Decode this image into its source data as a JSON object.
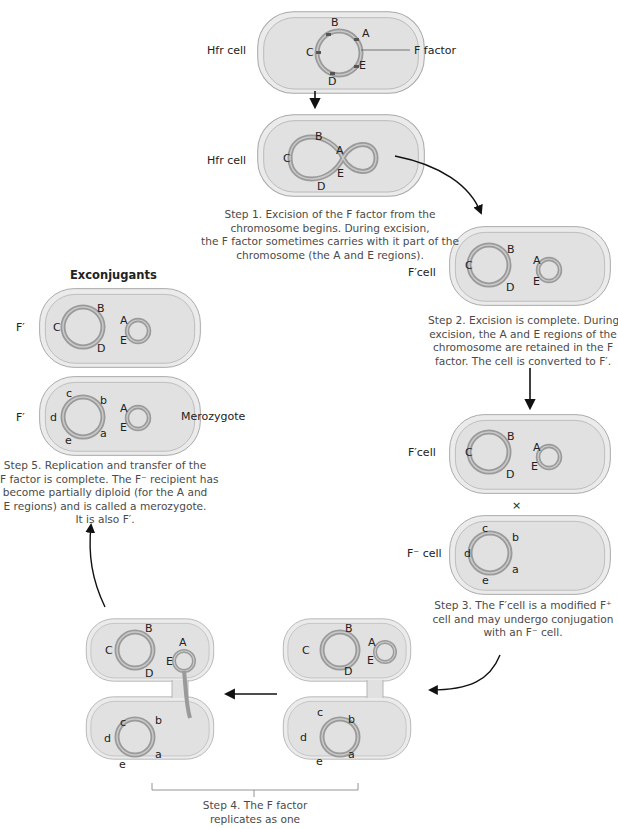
{
  "labels": {
    "hfr_cell_1": "Hfr cell",
    "hfr_cell_2": "Hfr cell",
    "f_factor": "F factor",
    "fprime_cell_1": "F′cell",
    "fprime_cell_2": "F′cell",
    "fminus_cell": "F⁻ cell",
    "exconjugants": "Exconjugants",
    "fprime_ex_1": "F′",
    "fprime_ex_2": "F′",
    "merozygote": "Merozygote",
    "cross": "×"
  },
  "genes_upper": [
    "A",
    "B",
    "C",
    "D",
    "E"
  ],
  "genes_lower": [
    "a",
    "b",
    "c",
    "d",
    "e"
  ],
  "steps": {
    "step1": [
      "Step 1. Excision of the F factor from the",
      "chromosome begins. During excision,",
      "the F factor sometimes carries with it part of the",
      "chromosome (the A and E regions)."
    ],
    "step2": [
      "Step 2. Excision is complete. During",
      "excision, the A and E regions of the",
      "chromosome are retained in the F",
      "factor. The cell is converted to F′."
    ],
    "step3": [
      "Step 3. The F′cell is a modified F⁺",
      "cell and may undergo conjugation",
      "with an F⁻ cell."
    ],
    "step4": [
      "Step 4. The F factor",
      "replicates as one"
    ],
    "step5": [
      "Step 5. Replication and transfer of the",
      "F factor is complete. The F⁻ recipient has",
      "become partially diploid (for the A and",
      "E regions) and is called a merozygote.",
      "It is also F′."
    ]
  },
  "colors": {
    "cell_fill": "#e4e4e4",
    "cell_wall": "#d6d6d6",
    "cell_outline": "#a8a8a8",
    "chromosome": "#9a9a9a",
    "marker": "#555555",
    "arrow": "#111111",
    "caption": "#4a4a4a"
  }
}
